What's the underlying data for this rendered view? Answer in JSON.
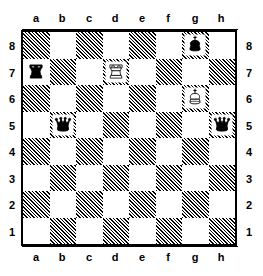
{
  "diagram": {
    "type": "chess-board-diagram",
    "orientation": "white-bottom",
    "files": [
      "a",
      "b",
      "c",
      "d",
      "e",
      "f",
      "g",
      "h"
    ],
    "ranks": [
      "8",
      "7",
      "6",
      "5",
      "4",
      "3",
      "2",
      "1"
    ],
    "colors": {
      "light_square": "#ffffff",
      "dark_square_hatch": "#000000",
      "border": "#000000",
      "label": "#000000"
    },
    "labels": {
      "file_top": [
        "a",
        "b",
        "c",
        "d",
        "e",
        "f",
        "g",
        "h"
      ],
      "file_bottom": [
        "a",
        "b",
        "c",
        "d",
        "e",
        "f",
        "g",
        "h"
      ],
      "rank_left": [
        "8",
        "7",
        "6",
        "5",
        "4",
        "3",
        "2",
        "1"
      ],
      "rank_right": [
        "8",
        "7",
        "6",
        "5",
        "4",
        "3",
        "2",
        "1"
      ]
    },
    "pieces": [
      {
        "square": "g8",
        "color": "black",
        "type": "king",
        "glyph": "black-king-icon"
      },
      {
        "square": "a7",
        "color": "black",
        "type": "rook",
        "glyph": "black-rook-icon"
      },
      {
        "square": "d7",
        "color": "white",
        "type": "rook",
        "glyph": "white-rook-icon"
      },
      {
        "square": "g6",
        "color": "white",
        "type": "king",
        "glyph": "white-king-icon"
      },
      {
        "square": "b5",
        "color": "black",
        "type": "queen",
        "glyph": "black-queen-icon"
      },
      {
        "square": "h5",
        "color": "black",
        "type": "queen",
        "glyph": "black-queen-icon"
      }
    ],
    "fen_placement": "6k1/r2R4/6K1/1q5q/8/8/8/8",
    "piece_count": {
      "white": 2,
      "black": 4,
      "total": 6
    }
  }
}
